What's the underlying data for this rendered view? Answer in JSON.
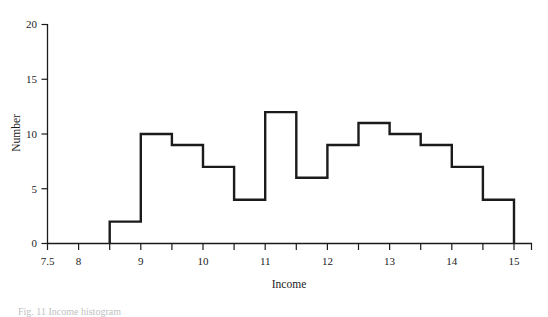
{
  "figure": {
    "caption": "Fig. 11  Income histogram"
  },
  "chart_data": {
    "type": "bar",
    "title": "",
    "subtitle": "",
    "xlabel": "Income",
    "ylabel": "Number",
    "grid": false,
    "legend": null,
    "xlim": [
      7.5,
      15.25
    ],
    "ylim": [
      0,
      20
    ],
    "bin_width": 0.5,
    "bin_edges": [
      8.5,
      9.0,
      9.5,
      10.0,
      10.5,
      11.0,
      11.5,
      12.0,
      12.5,
      13.0,
      13.5,
      14.0,
      14.5,
      15.0
    ],
    "categories": [
      "8.5-9.0",
      "9.0-9.5",
      "9.5-10.0",
      "10.0-10.5",
      "10.5-11.0",
      "11.0-11.5",
      "11.5-12.0",
      "12.0-12.5",
      "12.5-13.0",
      "13.0-13.5",
      "13.5-14.0",
      "14.0-14.5",
      "14.5-15.0"
    ],
    "values": [
      2,
      10,
      9,
      7,
      4,
      12,
      6,
      9,
      11,
      10,
      9,
      7,
      4
    ],
    "x_ticks": [
      7.5,
      8,
      8.5,
      9,
      9.5,
      10,
      10.5,
      11,
      11.5,
      12,
      12.5,
      13,
      13.5,
      14,
      14.5,
      15
    ],
    "x_tick_labels": [
      "7.5",
      "8",
      "",
      "9",
      "",
      "10",
      "",
      "11",
      "",
      "12",
      "",
      "13",
      "",
      "14",
      "",
      "15"
    ],
    "y_ticks": [
      0,
      5,
      10,
      15,
      20
    ],
    "y_tick_labels": [
      "0",
      "5",
      "10",
      "15",
      "20"
    ],
    "line_color": "#1b1b1b",
    "background_color": "#ffffff"
  },
  "axis": {
    "x_label": "Income",
    "y_label": "Number",
    "y_tick_0": "0",
    "y_tick_5": "5",
    "y_tick_10": "10",
    "y_tick_15": "15",
    "y_tick_20": "20",
    "x_tick_7_5": "7.5",
    "x_tick_8": "8",
    "x_tick_9": "9",
    "x_tick_10": "10",
    "x_tick_11": "11",
    "x_tick_12": "12",
    "x_tick_13": "13",
    "x_tick_14": "14",
    "x_tick_15": "15"
  }
}
